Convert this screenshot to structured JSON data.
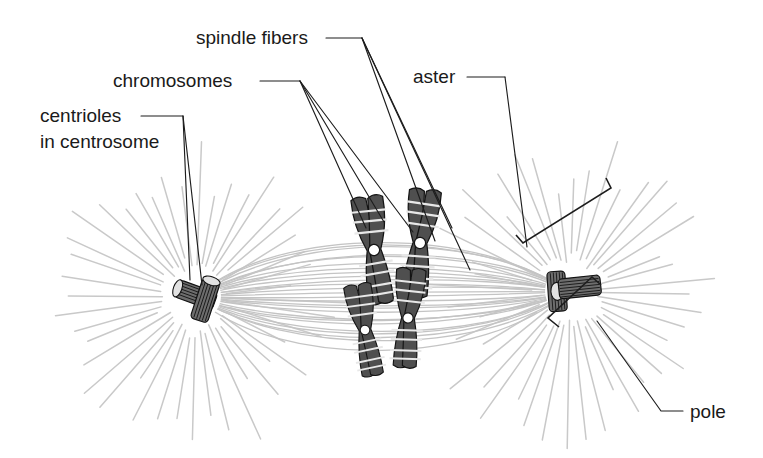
{
  "figure": {
    "background_color": "#ffffff",
    "width": 763,
    "height": 458
  },
  "labels": [
    {
      "id": "spindle-fibers",
      "text": "spindle fibers",
      "x": 196,
      "y": 44,
      "anchor": "start",
      "leader_count": 3,
      "points_to": "spindle-fiber-bundle"
    },
    {
      "id": "chromosomes",
      "text": "chromosomes",
      "x": 113,
      "y": 87,
      "anchor": "start",
      "leader_count": 3,
      "points_to": "chromosome-cluster"
    },
    {
      "id": "centrioles-line1",
      "text": "centrioles",
      "x": 40,
      "y": 122,
      "anchor": "start",
      "leader_count": 2,
      "points_to": "left-centrosome"
    },
    {
      "id": "centrioles-line2",
      "text": "in centrosome",
      "x": 40,
      "y": 148,
      "anchor": "start",
      "leader_count": 0,
      "points_to": "left-centrosome"
    },
    {
      "id": "aster",
      "text": "aster",
      "x": 413,
      "y": 83,
      "anchor": "start",
      "leader_count": 1,
      "points_to": "right-aster"
    },
    {
      "id": "pole",
      "text": "pole",
      "x": 690,
      "y": 418,
      "anchor": "start",
      "leader_count": 1,
      "points_to": "right-pole"
    }
  ],
  "structures": {
    "left_aster": {
      "name": "left aster",
      "center_x": 196,
      "center_y": 297,
      "ray_count": 44,
      "inner_radius": 28,
      "outer_radius": 150,
      "ray_color": "#c9c9c9"
    },
    "right_aster": {
      "name": "right aster",
      "center_x": 570,
      "center_y": 292,
      "ray_count": 44,
      "inner_radius": 28,
      "outer_radius": 150,
      "ray_color": "#c9c9c9"
    },
    "spindle": {
      "name": "spindle fiber bundle",
      "left_pole_x": 196,
      "left_pole_y": 297,
      "right_pole_x": 568,
      "right_pole_y": 292,
      "fiber_count": 26,
      "max_bulge": 78,
      "fiber_color": "#c4c4c4"
    },
    "left_centrosome": {
      "name": "centriole pair at left pole",
      "x": 196,
      "y": 295,
      "centriole_count": 2,
      "arrangement": "perpendicular"
    },
    "right_centrosome": {
      "name": "centriole pair at right pole",
      "x": 570,
      "y": 290,
      "centriole_count": 2,
      "arrangement": "perpendicular"
    },
    "chromosomes": {
      "name": "chromosome cluster at metaphase plate",
      "count": 4,
      "body_color": "#4f4f4f",
      "band_color": "#e8e8e8",
      "centromere_color": "#ffffff",
      "items": [
        {
          "id": "chromosome-1",
          "cx": 374,
          "cy": 250,
          "rotate": -8,
          "scale": 1.0
        },
        {
          "id": "chromosome-2",
          "cx": 420,
          "cy": 243,
          "rotate": 6,
          "scale": 1.0
        },
        {
          "id": "chromosome-3",
          "cx": 408,
          "cy": 318,
          "rotate": 4,
          "scale": 0.92
        },
        {
          "id": "chromosome-4",
          "cx": 365,
          "cy": 330,
          "rotate": -10,
          "scale": 0.86
        }
      ]
    }
  },
  "colors": {
    "ink": "#1d1d1d",
    "text": "#1a1a1a",
    "aster_gray": "#c9c9c9",
    "spindle_gray": "#c4c4c4",
    "chromosome_gray": "#4f4f4f",
    "band_light": "#e8e8e8",
    "centriole_gray": "#6d6d6d",
    "background": "#ffffff"
  }
}
